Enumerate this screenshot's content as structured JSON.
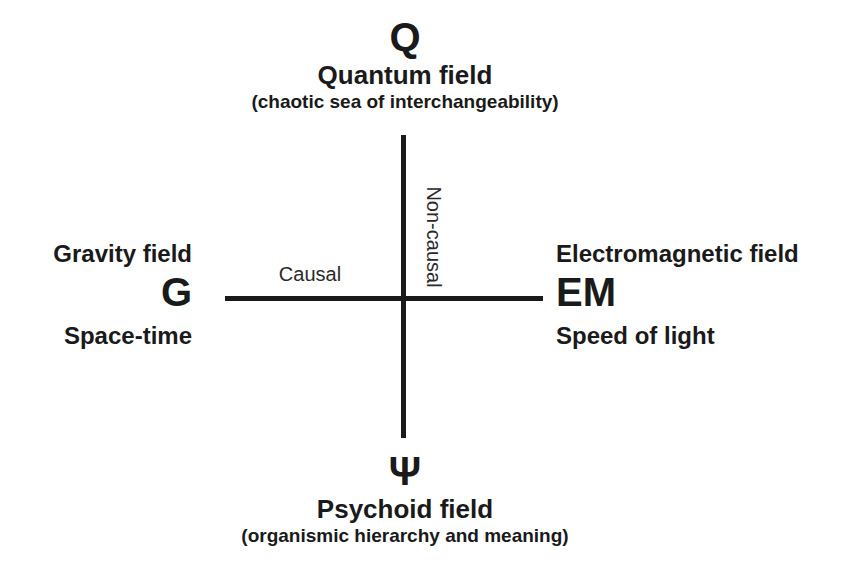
{
  "page": {
    "background_color": "#ffffff",
    "ink_color": "#1a1a1a"
  },
  "axes": {
    "horizontal_label": "Causal",
    "vertical_label": "Non-causal"
  },
  "nodes": {
    "top": {
      "symbol": "Q",
      "title": "Quantum field",
      "subtitle": "(chaotic sea of interchangeability)"
    },
    "left": {
      "symbol": "G",
      "title": "Gravity field",
      "subtitle": "Space-time"
    },
    "right": {
      "symbol": "EM",
      "title": "Electromagnetic field",
      "subtitle": "Speed of light"
    },
    "bottom": {
      "symbol": "Ψ",
      "title": "Psychoid field",
      "subtitle": "(organismic hierarchy and meaning)"
    }
  }
}
